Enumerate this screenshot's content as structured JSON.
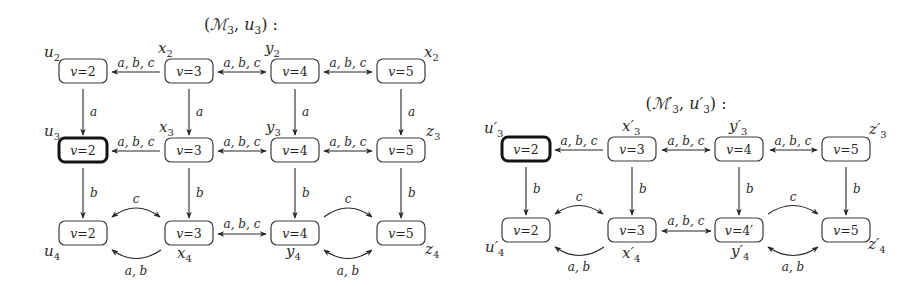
{
  "left": {
    "title": {
      "open": "(",
      "model": "ℳ",
      "model_sub": "3",
      "comma": ", ",
      "state": "u",
      "state_sub": "3",
      "close": ") :"
    },
    "nodes": {
      "u2": {
        "label_base": "u",
        "label_sub": "2",
        "var": "v",
        "val": "=2",
        "initial": false
      },
      "x2": {
        "label_base": "x",
        "label_sub": "2",
        "var": "v",
        "val": "=3",
        "initial": false
      },
      "y2": {
        "label_base": "y",
        "label_sub": "2",
        "var": "v",
        "val": "=4",
        "initial": false
      },
      "z2": {
        "label_base": "x",
        "label_sub": "2",
        "var": "v",
        "val": "=5",
        "initial": false
      },
      "u3": {
        "label_base": "u",
        "label_sub": "3",
        "var": "v",
        "val": "=2",
        "initial": true
      },
      "x3": {
        "label_base": "x",
        "label_sub": "3",
        "var": "v",
        "val": "=3",
        "initial": false
      },
      "y3": {
        "label_base": "y",
        "label_sub": "3",
        "var": "v",
        "val": "=4",
        "initial": false
      },
      "z3": {
        "label_base": "z",
        "label_sub": "3",
        "var": "v",
        "val": "=5",
        "initial": false
      },
      "u4": {
        "label_base": "u",
        "label_sub": "4",
        "var": "v",
        "val": "=2",
        "initial": false
      },
      "x4": {
        "label_base": "x",
        "label_sub": "4",
        "var": "v",
        "val": "=3",
        "initial": false
      },
      "y4": {
        "label_base": "y",
        "label_sub": "4",
        "var": "v",
        "val": "=4",
        "initial": false
      },
      "z4": {
        "label_base": "z",
        "label_sub": "4",
        "var": "v",
        "val": "=5",
        "initial": false
      }
    },
    "edges": [
      {
        "from": "x2",
        "to": "u2",
        "label": "a, b, c",
        "dir": "forward"
      },
      {
        "from": "x2",
        "to": "y2",
        "label": "a, b, c",
        "dir": "both"
      },
      {
        "from": "y2",
        "to": "z2",
        "label": "a, b, c",
        "dir": "both"
      },
      {
        "from": "u2",
        "to": "u3",
        "label": "a",
        "dir": "forward"
      },
      {
        "from": "x2",
        "to": "x3",
        "label": "a",
        "dir": "forward"
      },
      {
        "from": "y2",
        "to": "y3",
        "label": "a",
        "dir": "forward"
      },
      {
        "from": "z2",
        "to": "z3",
        "label": "a",
        "dir": "forward"
      },
      {
        "from": "x3",
        "to": "u3",
        "label": "a, b, c",
        "dir": "forward"
      },
      {
        "from": "x3",
        "to": "y3",
        "label": "a, b, c",
        "dir": "both"
      },
      {
        "from": "y3",
        "to": "z3",
        "label": "a, b, c",
        "dir": "both"
      },
      {
        "from": "u3",
        "to": "u4",
        "label": "b",
        "dir": "forward"
      },
      {
        "from": "x3",
        "to": "x4",
        "label": "b",
        "dir": "forward"
      },
      {
        "from": "y3",
        "to": "y4",
        "label": "b",
        "dir": "forward"
      },
      {
        "from": "z3",
        "to": "z4",
        "label": "b",
        "dir": "forward"
      },
      {
        "from": "u4",
        "to": "x4",
        "label": "c",
        "dir": "both"
      },
      {
        "from": "x4",
        "to": "u4",
        "label": "a, b",
        "dir": "forward"
      },
      {
        "from": "x4",
        "to": "y4",
        "label": "a, b, c",
        "dir": "both"
      },
      {
        "from": "y4",
        "to": "z4",
        "label": "c",
        "dir": "forward"
      },
      {
        "from": "y4",
        "to": "z4",
        "label": "a, b",
        "dir": "both"
      }
    ]
  },
  "right": {
    "title": {
      "open": "(",
      "model": "ℳ′",
      "model_sub": "3",
      "comma": ", ",
      "state": "u′",
      "state_sub": "3",
      "close": ") :"
    },
    "nodes": {
      "u3p": {
        "label_base": "u′",
        "label_sub": "3",
        "var": "v",
        "val": "=2",
        "initial": true
      },
      "x3p": {
        "label_base": "x′",
        "label_sub": "3",
        "var": "v",
        "val": "=3",
        "initial": false
      },
      "y3p": {
        "label_base": "y′",
        "label_sub": "3",
        "var": "v",
        "val": "=4",
        "initial": false
      },
      "z3p": {
        "label_base": "z′",
        "label_sub": "3",
        "var": "v",
        "val": "=5",
        "initial": false
      },
      "u4p": {
        "label_base": "u′",
        "label_sub": "4",
        "var": "v",
        "val": "=2",
        "initial": false
      },
      "x4p": {
        "label_base": "x′",
        "label_sub": "4",
        "var": "v",
        "val": "=3",
        "initial": false
      },
      "y4p": {
        "label_base": "y′",
        "label_sub": "4",
        "var": "v",
        "val": "=4′",
        "initial": false
      },
      "z4p": {
        "label_base": "z′",
        "label_sub": "4",
        "var": "v",
        "val": "=5",
        "initial": false
      }
    },
    "edges": [
      {
        "from": "x3p",
        "to": "u3p",
        "label": "a, b, c",
        "dir": "forward"
      },
      {
        "from": "x3p",
        "to": "y3p",
        "label": "a, b, c",
        "dir": "both"
      },
      {
        "from": "y3p",
        "to": "z3p",
        "label": "a, b, c",
        "dir": "both"
      },
      {
        "from": "u3p",
        "to": "u4p",
        "label": "b",
        "dir": "forward"
      },
      {
        "from": "x3p",
        "to": "x4p",
        "label": "b",
        "dir": "forward"
      },
      {
        "from": "y3p",
        "to": "y4p",
        "label": "b",
        "dir": "forward"
      },
      {
        "from": "z3p",
        "to": "z4p",
        "label": "b",
        "dir": "forward"
      },
      {
        "from": "u4p",
        "to": "x4p",
        "label": "c",
        "dir": "both"
      },
      {
        "from": "x4p",
        "to": "u4p",
        "label": "a, b",
        "dir": "forward"
      },
      {
        "from": "x4p",
        "to": "y4p",
        "label": "a, b, c",
        "dir": "both"
      },
      {
        "from": "y4p",
        "to": "z4p",
        "label": "c",
        "dir": "forward"
      },
      {
        "from": "y4p",
        "to": "z4p",
        "label": "a, b",
        "dir": "both"
      }
    ]
  }
}
